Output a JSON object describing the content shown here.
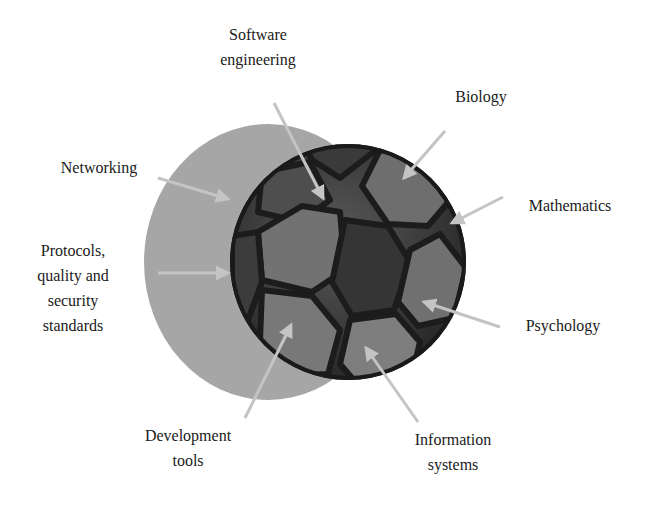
{
  "diagram": {
    "type": "soccer-ball-concept",
    "colors": {
      "background": "#ffffff",
      "shadow_disc": "#a4a4a4",
      "ball_dark": "#2e2e2e",
      "ball_panel": "#6a6a6a",
      "ball_panel_light": "#8c8c8c",
      "seam": "#1c1c1c",
      "arrow": "#c4c4c4",
      "text": "#1a1a1a"
    },
    "labels": [
      {
        "id": "software-engineering",
        "lines": [
          "Software",
          "engineering"
        ]
      },
      {
        "id": "biology",
        "lines": [
          "Biology"
        ]
      },
      {
        "id": "networking",
        "lines": [
          "Networking"
        ]
      },
      {
        "id": "mathematics",
        "lines": [
          "Mathematics"
        ]
      },
      {
        "id": "protocols",
        "lines": [
          "Protocols,",
          "quality and",
          "security",
          "standards"
        ]
      },
      {
        "id": "psychology",
        "lines": [
          "Psychology"
        ]
      },
      {
        "id": "development-tools",
        "lines": [
          "Development",
          "tools"
        ]
      },
      {
        "id": "information-systems",
        "lines": [
          "Information",
          "systems"
        ]
      }
    ]
  }
}
